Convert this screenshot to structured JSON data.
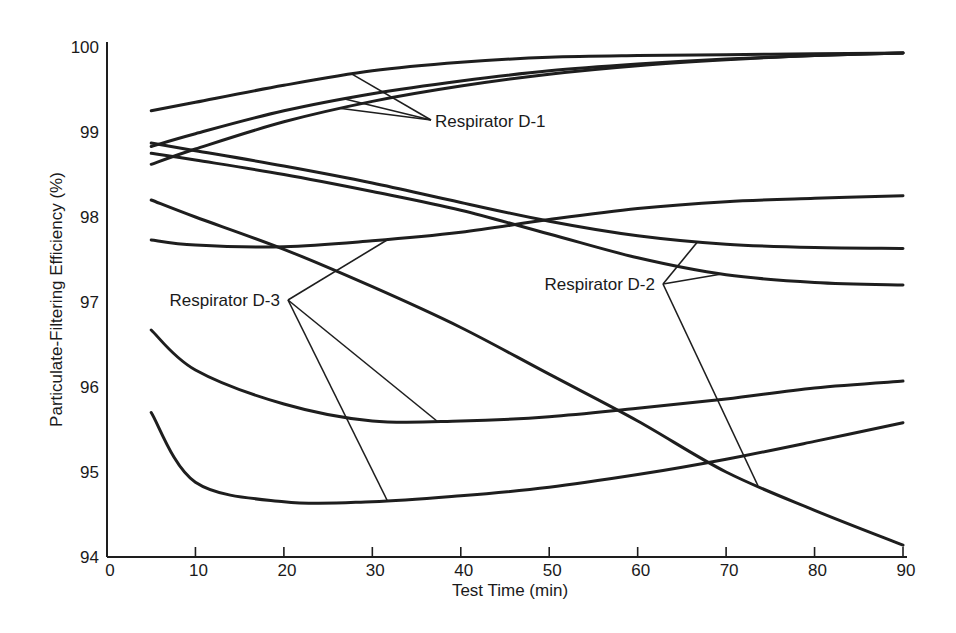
{
  "chart_data": {
    "type": "line",
    "title": "",
    "xlabel": "Test Time (min)",
    "ylabel": "Particulate-Filtering Efficiency (%)",
    "xlim": [
      0,
      90
    ],
    "ylim": [
      94,
      100
    ],
    "xticks": [
      0,
      10,
      20,
      30,
      40,
      50,
      60,
      70,
      80,
      90
    ],
    "yticks": [
      94,
      95,
      96,
      97,
      98,
      99,
      100
    ],
    "grid": false,
    "legend": "none (direct annotations)",
    "x": [
      5,
      10,
      20,
      30,
      40,
      50,
      60,
      70,
      80,
      90
    ],
    "series": [
      {
        "name": "Respirator D-1 (a)",
        "group": "Respirator D-1",
        "values": [
          99.25,
          99.35,
          99.55,
          99.72,
          99.82,
          99.88,
          99.9,
          99.91,
          99.92,
          99.93
        ]
      },
      {
        "name": "Respirator D-1 (b)",
        "group": "Respirator D-1",
        "values": [
          98.83,
          98.98,
          99.25,
          99.45,
          99.6,
          99.72,
          99.8,
          99.86,
          99.9,
          99.93
        ]
      },
      {
        "name": "Respirator D-1 (c)",
        "group": "Respirator D-1",
        "values": [
          98.62,
          98.8,
          99.12,
          99.36,
          99.54,
          99.68,
          99.78,
          99.85,
          99.9,
          99.93
        ]
      },
      {
        "name": "Respirator D-2 (a)",
        "group": "Respirator D-2",
        "values": [
          98.87,
          98.78,
          98.6,
          98.4,
          98.17,
          97.95,
          97.78,
          97.68,
          97.64,
          97.63
        ]
      },
      {
        "name": "Respirator D-2 (b)",
        "group": "Respirator D-2",
        "values": [
          98.75,
          98.67,
          98.5,
          98.3,
          98.08,
          97.8,
          97.52,
          97.32,
          97.23,
          97.2
        ]
      },
      {
        "name": "Respirator D-2 (c)",
        "group": "Respirator D-2",
        "values": [
          98.2,
          98.0,
          97.62,
          97.18,
          96.7,
          96.15,
          95.6,
          95.0,
          94.55,
          94.14
        ]
      },
      {
        "name": "Respirator D-3 (a)",
        "group": "Respirator D-3",
        "values": [
          97.73,
          97.67,
          97.65,
          97.72,
          97.82,
          97.97,
          98.1,
          98.18,
          98.22,
          98.25
        ]
      },
      {
        "name": "Respirator D-3 (b)",
        "group": "Respirator D-3",
        "values": [
          96.67,
          96.2,
          95.8,
          95.6,
          95.6,
          95.65,
          95.75,
          95.86,
          95.99,
          96.07
        ]
      },
      {
        "name": "Respirator D-3 (c)",
        "group": "Respirator D-3",
        "values": [
          95.7,
          94.88,
          94.65,
          94.65,
          94.72,
          94.82,
          94.97,
          95.15,
          95.36,
          95.58
        ]
      }
    ],
    "annotations": [
      {
        "text": "Respirator D-1",
        "targets": [
          "Respirator D-1 (a)",
          "Respirator D-1 (b)",
          "Respirator D-1 (c)"
        ]
      },
      {
        "text": "Respirator D-2",
        "targets": [
          "Respirator D-2 (a)",
          "Respirator D-2 (b)",
          "Respirator D-2 (c)"
        ]
      },
      {
        "text": "Respirator D-3",
        "targets": [
          "Respirator D-3 (a)",
          "Respirator D-3 (b)",
          "Respirator D-3 (c)"
        ]
      }
    ]
  }
}
